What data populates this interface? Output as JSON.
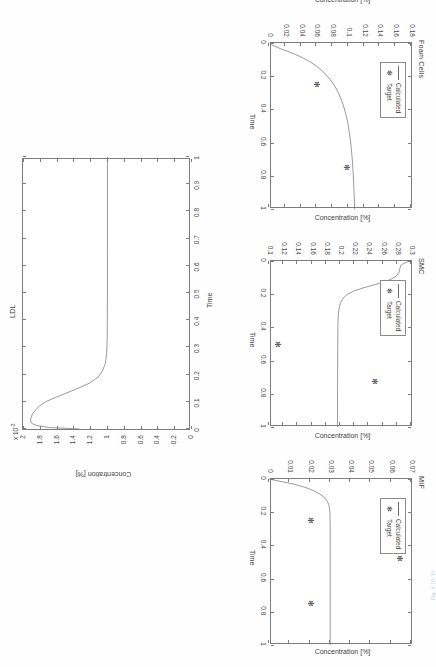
{
  "figure": {
    "orientation": "rotated-90-ccw",
    "background_color": "#ffffff",
    "line_color": "#6f6f6f",
    "axis_color": "#7d7d7d",
    "text_color": "#3f3f3f",
    "caption_text": "Fig. 4.10: Fi"
  },
  "legend": {
    "calculated_label": "Calculated",
    "target_label": "Target",
    "marker_glyph": "✻"
  },
  "chart_data": [
    {
      "id": "ldl",
      "type": "line",
      "title": "LDL",
      "xlabel": "Time",
      "ylabel": "Concentration [%]",
      "exponent_label": "x 10",
      "exponent_sup": "-3",
      "xlim": [
        0,
        1
      ],
      "ylim": [
        0,
        2
      ],
      "xticks": [
        0,
        0.1,
        0.2,
        0.3,
        0.4,
        0.5,
        0.6,
        0.7,
        0.8,
        0.9,
        1
      ],
      "xticklabels": [
        "0",
        "0.1",
        "0.2",
        "0.3",
        "0.4",
        "0.5",
        "0.6",
        "0.7",
        "0.8",
        "0.9",
        "1"
      ],
      "yticks": [
        0,
        0.2,
        0.4,
        0.6,
        0.8,
        1,
        1.2,
        1.4,
        1.6,
        1.8,
        2
      ],
      "yticklabels": [
        "0",
        "0.2",
        "0.4",
        "0.6",
        "0.8",
        "1",
        "1.2",
        "1.4",
        "1.6",
        "1.8",
        "2"
      ],
      "grid": false,
      "has_legend": false,
      "series": [
        {
          "name": "Calculated",
          "x": [
            0.0,
            0.005,
            0.012,
            0.02,
            0.03,
            0.042,
            0.055,
            0.07,
            0.085,
            0.1,
            0.115,
            0.13,
            0.15,
            0.17,
            0.19,
            0.21,
            0.24,
            0.28,
            0.33,
            0.4,
            0.5,
            0.65,
            0.8,
            1.0
          ],
          "y": [
            1.33,
            1.66,
            1.82,
            1.88,
            1.9,
            1.893,
            1.875,
            1.84,
            1.79,
            1.72,
            1.62,
            1.5,
            1.34,
            1.2,
            1.11,
            1.06,
            1.02,
            1.003,
            0.998,
            0.996,
            0.995,
            0.995,
            0.995,
            0.995
          ]
        }
      ],
      "targets": []
    },
    {
      "id": "foam-cells",
      "type": "line",
      "title": "Foam Cells",
      "xlabel": "Time",
      "ylabel": "Concentration [%]",
      "xlim": [
        0,
        1
      ],
      "ylim": [
        0,
        0.18
      ],
      "xticks": [
        0,
        0.2,
        0.4,
        0.6,
        0.8,
        1
      ],
      "xticklabels": [
        "0",
        "0.2",
        "0.4",
        "0.6",
        "0.8",
        "1"
      ],
      "yticks": [
        0,
        0.02,
        0.04,
        0.06,
        0.08,
        0.1,
        0.12,
        0.14,
        0.16,
        0.18
      ],
      "yticklabels": [
        "0",
        "0.02",
        "0.04",
        "0.06",
        "0.08",
        "0.1",
        "0.12",
        "0.14",
        "0.16",
        "0.18"
      ],
      "grid": false,
      "has_legend": true,
      "series": [
        {
          "name": "Calculated",
          "x": [
            0.0,
            0.01,
            0.02,
            0.035,
            0.05,
            0.07,
            0.09,
            0.11,
            0.135,
            0.16,
            0.19,
            0.22,
            0.26,
            0.3,
            0.34,
            0.38,
            0.43,
            0.48,
            0.54,
            0.6,
            0.66,
            0.72,
            0.78,
            0.85,
            0.92,
            1.0
          ],
          "y": [
            0.0005,
            0.003,
            0.0075,
            0.015,
            0.0235,
            0.034,
            0.043,
            0.051,
            0.059,
            0.0655,
            0.072,
            0.0775,
            0.0835,
            0.088,
            0.0915,
            0.0945,
            0.0975,
            0.0998,
            0.1018,
            0.1035,
            0.1048,
            0.1058,
            0.1066,
            0.1074,
            0.108,
            0.1085
          ]
        }
      ],
      "targets": [
        {
          "x": 0.25,
          "y": 0.06
        },
        {
          "x": 0.75,
          "y": 0.098
        }
      ]
    },
    {
      "id": "smc",
      "type": "line",
      "title": "SMC",
      "xlabel": "Time",
      "ylabel": "Concentration [%]",
      "xlim": [
        0,
        1
      ],
      "ylim": [
        0.1,
        0.3
      ],
      "xticks": [
        0,
        0.2,
        0.4,
        0.6,
        0.8,
        1
      ],
      "xticklabels": [
        "0",
        "0.2",
        "0.4",
        "0.6",
        "0.8",
        "1"
      ],
      "yticks": [
        0.1,
        0.12,
        0.14,
        0.16,
        0.18,
        0.2,
        0.22,
        0.24,
        0.26,
        0.28,
        0.3
      ],
      "yticklabels": [
        "0.1",
        "0.12",
        "0.14",
        "0.16",
        "0.18",
        "0.2",
        "0.22",
        "0.24",
        "0.26",
        "0.28",
        "0.3"
      ],
      "grid": false,
      "has_legend": true,
      "series": [
        {
          "name": "Calculated",
          "x": [
            0.0,
            0.008,
            0.018,
            0.03,
            0.042,
            0.055,
            0.07,
            0.085,
            0.1,
            0.115,
            0.13,
            0.145,
            0.16,
            0.18,
            0.2,
            0.225,
            0.255,
            0.29,
            0.33,
            0.39,
            0.47,
            0.57,
            0.7,
            0.85,
            1.0
          ],
          "y": [
            0.3,
            0.293,
            0.288,
            0.2855,
            0.2845,
            0.284,
            0.283,
            0.2805,
            0.276,
            0.269,
            0.259,
            0.247,
            0.234,
            0.22,
            0.2105,
            0.204,
            0.2005,
            0.1985,
            0.1975,
            0.197,
            0.1968,
            0.1967,
            0.1966,
            0.1965,
            0.1965
          ]
        }
      ],
      "targets": [
        {
          "x": 0.245,
          "y": 0.282
        },
        {
          "x": 0.725,
          "y": 0.248
        },
        {
          "x": 0.5,
          "y": 0.112
        }
      ]
    },
    {
      "id": "mif",
      "type": "line",
      "title": "MIF",
      "xlabel": "Time",
      "ylabel": "Concentration [%]",
      "xlim": [
        0,
        1
      ],
      "ylim": [
        0,
        0.07
      ],
      "xticks": [
        0,
        0.2,
        0.4,
        0.6,
        0.8,
        1
      ],
      "xticklabels": [
        "0",
        "0.2",
        "0.4",
        "0.6",
        "0.8",
        "1"
      ],
      "yticks": [
        0,
        0.01,
        0.02,
        0.03,
        0.04,
        0.05,
        0.06,
        0.07
      ],
      "yticklabels": [
        "0",
        "0.01",
        "0.02",
        "0.03",
        "0.04",
        "0.05",
        "0.06",
        "0.07"
      ],
      "grid": false,
      "has_legend": true,
      "series": [
        {
          "name": "Calculated",
          "x": [
            0.0,
            0.008,
            0.018,
            0.03,
            0.045,
            0.06,
            0.078,
            0.095,
            0.115,
            0.135,
            0.155,
            0.175,
            0.195,
            0.215,
            0.24,
            0.27,
            0.31,
            0.37,
            0.45,
            0.56,
            0.7,
            0.85,
            1.0
          ],
          "y": [
            0.0,
            0.003,
            0.0072,
            0.0118,
            0.0165,
            0.02,
            0.0232,
            0.0256,
            0.0276,
            0.0288,
            0.0295,
            0.0298,
            0.03,
            0.0301,
            0.0301,
            0.0302,
            0.0302,
            0.0302,
            0.0302,
            0.0302,
            0.0302,
            0.0302,
            0.0302
          ]
        }
      ],
      "targets": [
        {
          "x": 0.25,
          "y": 0.02
        },
        {
          "x": 0.48,
          "y": 0.064
        },
        {
          "x": 0.75,
          "y": 0.02
        }
      ]
    }
  ]
}
